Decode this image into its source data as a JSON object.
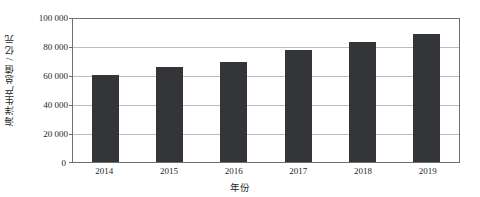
{
  "chart_data": {
    "type": "bar",
    "title": "",
    "xlabel": "年份",
    "ylabel": "海洋生产总值 / 亿元",
    "categories": [
      "2014",
      "2015",
      "2016",
      "2017",
      "2018",
      "2019"
    ],
    "values": [
      60000,
      65500,
      69000,
      77000,
      83000,
      88500
    ],
    "series": [
      {
        "name": "海洋生产总值",
        "values": [
          60000,
          65500,
          69000,
          77000,
          83000,
          88500
        ]
      }
    ],
    "ylim": [
      0,
      100000
    ],
    "yticks": [
      0,
      20000,
      40000,
      60000,
      80000,
      100000
    ],
    "ytick_labels": [
      "0",
      "20 000",
      "40 000",
      "60 000",
      "80 000",
      "100 000"
    ],
    "grid": "horizontal",
    "legend": "none",
    "bar_color": "#333538",
    "gridline_color": "#bdbdbd",
    "axis_color": "#6e6e6e",
    "background": "#ffffff"
  }
}
